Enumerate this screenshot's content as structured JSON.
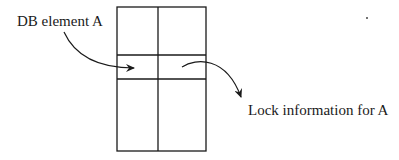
{
  "diagram": {
    "type": "lock-table-illustration",
    "labels": {
      "db_element": "DB element A",
      "lock_info": "Lock information for A"
    },
    "grid": {
      "rows": 3,
      "columns": 2,
      "highlighted_row": 2
    },
    "arrows": [
      {
        "from": "DB element A",
        "to": "grid row 2, column 1"
      },
      {
        "from": "grid row 2, column 2",
        "to": "Lock information for A"
      }
    ],
    "colors": {
      "stroke": "#1a1a1a",
      "background": "#ffffff"
    }
  }
}
